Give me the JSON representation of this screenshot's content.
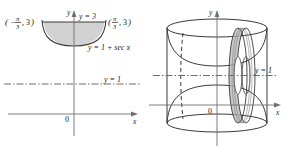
{
  "figure": {
    "type": "calculus-solid-of-revolution",
    "panels": [
      {
        "id": "left-2d-region",
        "name": "plane-region",
        "axes": {
          "x_label": "x",
          "y_label": "y",
          "origin_label": "0"
        },
        "curves": [
          {
            "name": "upper-boundary",
            "label": "y = 3",
            "equation": "y = 3"
          },
          {
            "name": "lower-boundary",
            "label": "y = 1 + sec x",
            "equation": "y = 1 + sec x"
          },
          {
            "name": "axis-of-revolution",
            "label": "y = 1",
            "equation": "y = 1",
            "style": "dash-dot"
          }
        ],
        "points": [
          {
            "name": "left-corner",
            "label": "(−π/3, 3)",
            "numerator": "π",
            "denominator": "3",
            "sign": "−",
            "y": "3"
          },
          {
            "name": "right-corner",
            "label": "(π/3, 3)",
            "numerator": "π",
            "denominator": "3",
            "sign": "",
            "y": "3"
          }
        ],
        "shaded_region": {
          "name": "region-between-curves",
          "fill_color": "#d2d2d2",
          "description": "region bounded above by y = 3 and below by y = 1 + sec x"
        }
      },
      {
        "id": "right-3d-solid",
        "name": "solid-of-revolution",
        "axes": {
          "x_label": "x",
          "y_label": "y",
          "origin_label": "0"
        },
        "curves": [
          {
            "name": "axis-of-revolution",
            "label": "y = 1",
            "equation": "y = 1",
            "style": "dash-dot"
          }
        ],
        "shaded_region": {
          "name": "washer-cross-section",
          "fill_color": "#b8b8b8",
          "description": "representative washer slice perpendicular to the axis of revolution"
        }
      }
    ],
    "colors": {
      "stroke": "#3a3a3a",
      "light_stroke": "#8a8a8a",
      "shade_2d": "#d2d2d2",
      "shade_3d": "#b8b8b8",
      "background": "#ffffff"
    }
  }
}
